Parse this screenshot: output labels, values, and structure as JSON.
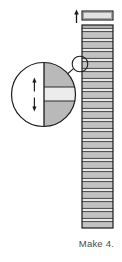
{
  "figure": {
    "kind": "quilt-strip-piecing-diagram",
    "caption": "Make 4.",
    "colors": {
      "outline": "#1a1a1a",
      "seam_line": "#2b2b2b",
      "dark_fabric": "#b9b9b9",
      "light_fabric": "#e6e6e6",
      "mid_fabric": "#cfcfcf",
      "paper": "#ffffff",
      "caption_text": "#4a4a4a"
    },
    "top_piece": {
      "label": "cut segment",
      "x": 82,
      "y": 11,
      "width": 31,
      "height": 9
    },
    "arrow_up": {
      "label": "cut direction arrow",
      "x": 75,
      "y": 10,
      "height": 13
    },
    "strip_unit": {
      "label": "pieced strip set",
      "x": 82,
      "y": 25,
      "width": 31,
      "height": 203,
      "band_count": 30,
      "bands": [
        {
          "h": 3.4,
          "tone": "dark"
        },
        {
          "h": 3.2,
          "tone": "light"
        },
        {
          "h": 6.8,
          "tone": "dark"
        },
        {
          "h": 3.2,
          "tone": "light"
        },
        {
          "h": 6.8,
          "tone": "dark"
        },
        {
          "h": 3.2,
          "tone": "light"
        },
        {
          "h": 6.8,
          "tone": "dark"
        },
        {
          "h": 3.2,
          "tone": "light"
        },
        {
          "h": 6.8,
          "tone": "dark"
        },
        {
          "h": 3.2,
          "tone": "light"
        },
        {
          "h": 6.8,
          "tone": "dark"
        },
        {
          "h": 3.2,
          "tone": "light"
        },
        {
          "h": 6.8,
          "tone": "dark"
        },
        {
          "h": 3.2,
          "tone": "light"
        },
        {
          "h": 6.8,
          "tone": "dark"
        },
        {
          "h": 3.2,
          "tone": "light"
        },
        {
          "h": 6.8,
          "tone": "dark"
        },
        {
          "h": 3.2,
          "tone": "light"
        },
        {
          "h": 6.8,
          "tone": "dark"
        },
        {
          "h": 3.2,
          "tone": "light"
        },
        {
          "h": 6.8,
          "tone": "dark"
        },
        {
          "h": 3.2,
          "tone": "light"
        },
        {
          "h": 6.8,
          "tone": "dark"
        },
        {
          "h": 3.2,
          "tone": "light"
        },
        {
          "h": 6.8,
          "tone": "dark"
        },
        {
          "h": 3.2,
          "tone": "light"
        },
        {
          "h": 6.8,
          "tone": "dark"
        },
        {
          "h": 3.2,
          "tone": "light"
        },
        {
          "h": 6.8,
          "tone": "dark"
        },
        {
          "h": 3.2,
          "tone": "light"
        }
      ]
    },
    "callout_marker": {
      "label": "detail marker circle",
      "cx": 80,
      "cy": 64,
      "r": 8
    },
    "callout_leader": {
      "label": "leader line",
      "x1": 74,
      "y1": 69,
      "x2": 62,
      "y2": 80
    },
    "magnifier": {
      "label": "magnified seam detail",
      "cx": 43.5,
      "cy": 94.5,
      "r": 32.5,
      "fabric_edge_x": 44,
      "seam_top_y": 87,
      "seam_bottom_y": 101,
      "dimension_arrow": {
        "label": "seam allowance dimension arrow",
        "x": 34,
        "y_top": 78,
        "y_bottom": 112
      }
    }
  }
}
